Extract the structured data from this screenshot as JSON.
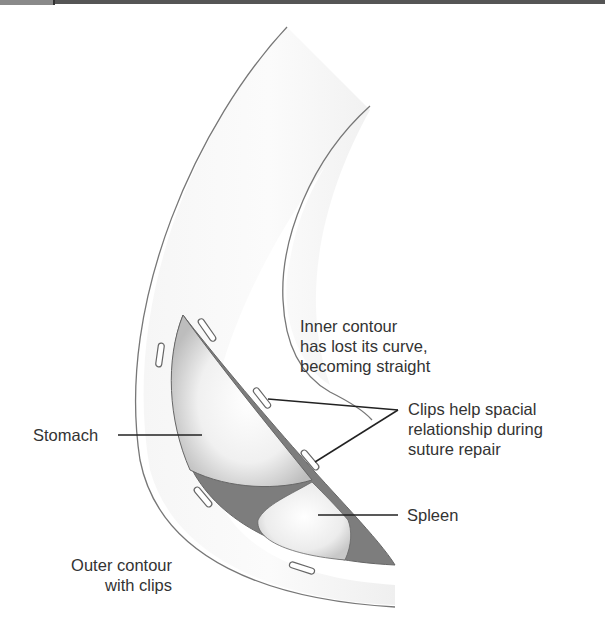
{
  "figure": {
    "labels": {
      "inner_contour": [
        "Inner contour",
        "has lost its curve,",
        "becoming straight"
      ],
      "clips": [
        "Clips help spacial",
        "relationship during",
        "suture repair"
      ],
      "stomach": "Stomach",
      "spleen": "Spleen",
      "outer_contour": [
        "Outer contour",
        "with clips"
      ]
    },
    "colors": {
      "outline": "#777777",
      "organ_dark": "#7d7d7d",
      "organ_light": "#f2f2f2",
      "text": "#333333"
    }
  }
}
